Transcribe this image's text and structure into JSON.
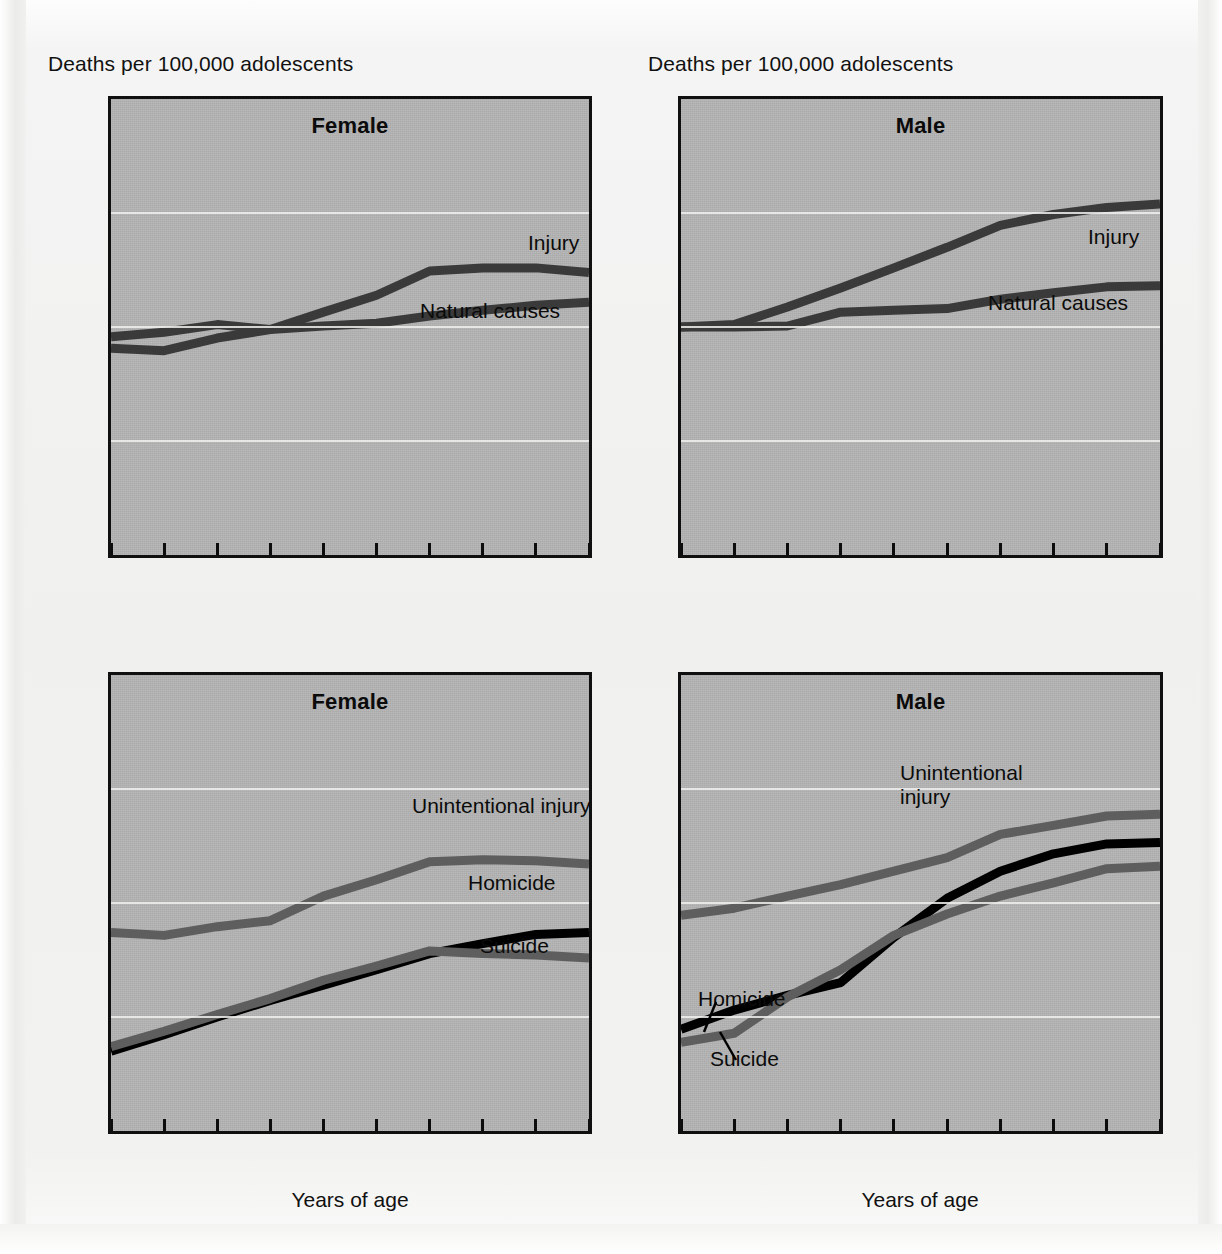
{
  "figure": {
    "y_axis_header": "Deaths per 100,000 adolescents",
    "x_axis_caption": "Years of age"
  },
  "panels": [
    {
      "id": "top-left",
      "title": "Female",
      "labels": [
        {
          "name": "injury",
          "text": "Injury"
        },
        {
          "name": "natural-causes",
          "text": "Natural causes"
        }
      ]
    },
    {
      "id": "top-right",
      "title": "Male",
      "labels": [
        {
          "name": "injury",
          "text": "Injury"
        },
        {
          "name": "natural-causes",
          "text": "Natural causes"
        }
      ]
    },
    {
      "id": "bottom-left",
      "title": "Female",
      "labels": [
        {
          "name": "unintentional-injury",
          "text": "Unintentional injury"
        },
        {
          "name": "homicide",
          "text": "Homicide"
        },
        {
          "name": "suicide",
          "text": "Suicide"
        }
      ]
    },
    {
      "id": "bottom-right",
      "title": "Male",
      "labels": [
        {
          "name": "unintentional-injury-1",
          "text": "Unintentional"
        },
        {
          "name": "unintentional-injury-2",
          "text": "injury"
        },
        {
          "name": "homicide",
          "text": "Homicide"
        },
        {
          "name": "suicide",
          "text": "Suicide"
        }
      ]
    }
  ],
  "axis": {
    "y_ticklabels": [
      "1,000",
      "100",
      "10",
      "1",
      ".1"
    ],
    "y_tickvalues": [
      1000,
      100,
      10,
      1,
      0.1
    ],
    "x_ticklabels": [
      "10",
      "11",
      "12",
      "13",
      "14",
      "15",
      "16",
      "17",
      "18",
      "19"
    ],
    "ylim": [
      0.1,
      1000
    ],
    "xlim": [
      10,
      19
    ],
    "yscale": "log"
  },
  "colors": {
    "plot_background": "#b4b4b4",
    "axis": "#101010",
    "gridline": "#f0f0ee",
    "series_dark": "#3a3a3a",
    "series_black": "#000000",
    "series_gray": "#5e5e5e",
    "text": "#111111"
  },
  "chart_data": [
    {
      "type": "line",
      "panel": "top-left",
      "title": "Female",
      "xlabel": "",
      "ylabel": "Deaths per 100,000 adolescents",
      "yscale": "log",
      "ylim": [
        0.1,
        1000
      ],
      "xlim": [
        10,
        19
      ],
      "grid": true,
      "legend": "inline-annotation",
      "x": [
        10,
        11,
        12,
        13,
        14,
        15,
        16,
        17,
        18,
        19
      ],
      "series": [
        {
          "name": "Injury",
          "color": "#3a3a3a",
          "values": [
            6.5,
            6.2,
            8.0,
            9.5,
            13.5,
            19.0,
            31.0,
            33.0,
            33.0,
            30.0
          ]
        },
        {
          "name": "Natural causes",
          "color": "#3a3a3a",
          "values": [
            8.2,
            9.0,
            10.5,
            9.5,
            10.2,
            10.8,
            12.5,
            14.0,
            15.5,
            16.5
          ]
        }
      ]
    },
    {
      "type": "line",
      "panel": "top-right",
      "title": "Male",
      "xlabel": "",
      "ylabel": "Deaths per 100,000 adolescents",
      "yscale": "log",
      "ylim": [
        0.1,
        1000
      ],
      "xlim": [
        10,
        19
      ],
      "grid": true,
      "legend": "inline-annotation",
      "x": [
        10,
        11,
        12,
        13,
        14,
        15,
        16,
        17,
        18,
        19
      ],
      "series": [
        {
          "name": "Injury",
          "color": "#3a3a3a",
          "values": [
            10.0,
            10.5,
            15.0,
            22.0,
            33.0,
            50.0,
            78.0,
            97.0,
            112.0,
            120.0
          ]
        },
        {
          "name": "Natural causes",
          "color": "#3a3a3a",
          "values": [
            10.0,
            10.0,
            10.2,
            13.5,
            14.0,
            14.5,
            17.5,
            20.0,
            22.5,
            23.0
          ]
        }
      ]
    },
    {
      "type": "line",
      "panel": "bottom-left",
      "title": "Female",
      "xlabel": "Years of age",
      "ylabel": "",
      "yscale": "log",
      "ylim": [
        0.1,
        1000
      ],
      "xlim": [
        10,
        19
      ],
      "grid": true,
      "legend": "inline-annotation",
      "x": [
        10,
        11,
        12,
        13,
        14,
        15,
        16,
        17,
        18,
        19
      ],
      "series": [
        {
          "name": "Unintentional injury",
          "color": "#5e5e5e",
          "values": [
            5.5,
            5.2,
            6.2,
            7.0,
            11.5,
            16.0,
            23.0,
            24.0,
            23.5,
            22.0
          ]
        },
        {
          "name": "Homicide",
          "color": "#000000",
          "values": [
            0.5,
            0.7,
            1.0,
            1.4,
            1.9,
            2.6,
            3.6,
            4.4,
            5.3,
            5.5
          ]
        },
        {
          "name": "Suicide",
          "color": "#5e5e5e",
          "values": [
            0.55,
            0.75,
            1.05,
            1.45,
            2.1,
            2.8,
            3.8,
            3.6,
            3.5,
            3.3
          ]
        }
      ]
    },
    {
      "type": "line",
      "panel": "bottom-right",
      "title": "Male",
      "xlabel": "Years of age",
      "ylabel": "",
      "yscale": "log",
      "ylim": [
        0.1,
        1000
      ],
      "xlim": [
        10,
        19
      ],
      "grid": true,
      "legend": "inline-annotation",
      "x": [
        10,
        11,
        12,
        13,
        14,
        15,
        16,
        17,
        18,
        19
      ],
      "series": [
        {
          "name": "Unintentional injury",
          "color": "#5e5e5e",
          "values": [
            7.8,
            9.0,
            11.5,
            14.5,
            19.0,
            25.0,
            40.0,
            48.0,
            58.0,
            60.0
          ]
        },
        {
          "name": "Homicide",
          "color": "#000000",
          "values": [
            0.78,
            1.15,
            1.55,
            2.0,
            5.0,
            11.0,
            19.0,
            27.0,
            33.0,
            34.0
          ]
        },
        {
          "name": "Suicide",
          "color": "#5e5e5e",
          "values": [
            0.6,
            0.72,
            1.5,
            2.6,
            5.2,
            8.0,
            11.5,
            15.0,
            20.0,
            21.0
          ]
        }
      ]
    }
  ]
}
